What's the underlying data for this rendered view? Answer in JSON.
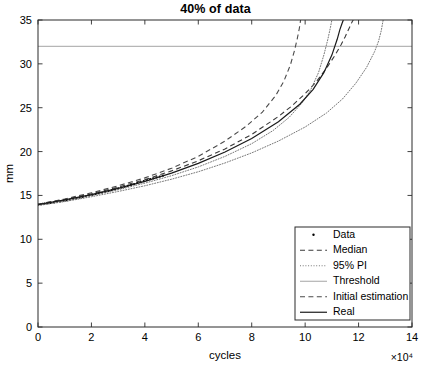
{
  "chart_data": {
    "type": "line",
    "title": "40% of data",
    "xlabel": "cycles",
    "ylabel": "mm",
    "x_exponent_label": "×10⁴",
    "x_multiplier": 10000,
    "xlim": [
      0,
      14
    ],
    "ylim": [
      0,
      35
    ],
    "xticks": [
      0,
      2,
      4,
      6,
      8,
      10,
      12,
      14
    ],
    "yticks": [
      0,
      5,
      10,
      15,
      20,
      25,
      30,
      35
    ],
    "xticklabels": [
      "0",
      "2",
      "4",
      "6",
      "8",
      "10",
      "12",
      "14"
    ],
    "yticklabels": [
      "0",
      "5",
      "10",
      "15",
      "20",
      "25",
      "30",
      "35"
    ],
    "grid": false,
    "legend_position": "lower right",
    "threshold_value": 32,
    "series": [
      {
        "name": "Data",
        "style": "dot-marker",
        "color": "#000000",
        "x": [
          0.0,
          0.12,
          0.24,
          0.36,
          0.48,
          0.6,
          0.72,
          0.84,
          0.96,
          1.08,
          1.2,
          1.32,
          1.44,
          1.56,
          1.68,
          1.8,
          1.92,
          2.04,
          2.16,
          2.28,
          2.4,
          2.52,
          2.64,
          2.76,
          2.88,
          3.0,
          3.12,
          3.24,
          3.36,
          3.48,
          3.6,
          3.72,
          3.84,
          3.96,
          4.08,
          4.2,
          4.32,
          4.44,
          4.56,
          4.68
        ],
        "y": [
          13.95,
          14.0,
          14.05,
          14.1,
          14.15,
          14.2,
          14.28,
          14.33,
          14.4,
          14.45,
          14.52,
          14.6,
          14.68,
          14.75,
          14.82,
          14.9,
          15.0,
          15.08,
          15.16,
          15.25,
          15.33,
          15.42,
          15.5,
          15.6,
          15.7,
          15.8,
          15.9,
          16.0,
          16.1,
          16.2,
          16.3,
          16.42,
          16.52,
          16.63,
          16.74,
          16.85,
          16.95,
          17.05,
          17.15,
          17.25
        ]
      },
      {
        "name": "Median",
        "style": "dashed",
        "color": "#3a3a3a",
        "x": [
          0.0,
          1.0,
          2.0,
          3.0,
          4.0,
          5.0,
          6.0,
          7.0,
          8.0,
          9.0,
          9.5,
          10.0,
          10.4,
          10.8,
          11.1,
          11.35,
          11.5,
          11.62,
          11.7,
          11.76,
          11.8
        ],
        "y": [
          14.0,
          14.55,
          15.2,
          15.95,
          16.8,
          17.8,
          18.95,
          20.3,
          21.95,
          24.0,
          25.2,
          26.6,
          27.9,
          29.5,
          30.9,
          32.2,
          33.1,
          33.9,
          34.4,
          34.8,
          35.0
        ]
      },
      {
        "name": "95% PI",
        "style": "dotted",
        "color": "#777777",
        "x_lower": [
          0.0,
          1.0,
          2.0,
          3.0,
          4.0,
          5.0,
          6.0,
          7.0,
          8.0,
          8.8,
          9.4,
          9.9,
          10.2,
          10.5,
          10.7,
          10.85,
          10.95,
          11.0
        ],
        "y_lower": [
          13.9,
          14.4,
          15.0,
          15.65,
          16.4,
          17.25,
          18.25,
          19.45,
          20.9,
          22.4,
          23.9,
          25.6,
          27.0,
          29.0,
          31.0,
          32.8,
          34.2,
          35.0
        ],
        "x_upper": [
          0.0,
          1.0,
          2.0,
          3.0,
          4.0,
          5.0,
          6.0,
          7.0,
          8.0,
          9.0,
          10.0,
          10.8,
          11.4,
          11.9,
          12.3,
          12.6,
          12.75,
          12.85,
          12.92
        ],
        "y_upper": [
          13.85,
          14.3,
          14.85,
          15.45,
          16.1,
          16.85,
          17.7,
          18.7,
          19.85,
          21.2,
          22.8,
          24.4,
          26.0,
          27.8,
          29.6,
          31.4,
          32.6,
          33.8,
          35.0
        ]
      },
      {
        "name": "Threshold",
        "style": "solid-thin",
        "color": "#9a9a9a",
        "x": [
          0,
          14
        ],
        "y": [
          32,
          32
        ]
      },
      {
        "name": "Initial estimation",
        "style": "dashed",
        "color": "#4a4a4a",
        "x": [
          0.0,
          1.0,
          2.0,
          3.0,
          4.0,
          5.0,
          6.0,
          7.0,
          7.8,
          8.4,
          8.9,
          9.2,
          9.45,
          9.6,
          9.7,
          9.78,
          9.83
        ],
        "y": [
          14.0,
          14.6,
          15.3,
          16.1,
          17.0,
          18.1,
          19.45,
          21.2,
          22.9,
          24.5,
          26.4,
          28.0,
          29.9,
          31.5,
          32.8,
          34.0,
          35.0
        ]
      },
      {
        "name": "Real",
        "style": "solid",
        "color": "#1a1a1a",
        "x": [
          0.0,
          1.0,
          2.0,
          3.0,
          4.0,
          5.0,
          6.0,
          7.0,
          8.0,
          9.0,
          9.8,
          10.3,
          10.7,
          11.0,
          11.2,
          11.3,
          11.38,
          11.43
        ],
        "y": [
          13.95,
          14.5,
          15.1,
          15.8,
          16.6,
          17.55,
          18.65,
          19.95,
          21.5,
          23.4,
          25.4,
          27.1,
          29.0,
          31.0,
          32.8,
          33.9,
          34.6,
          35.0
        ]
      }
    ]
  },
  "legend": {
    "items": [
      {
        "label": "Data",
        "style": "dot-marker"
      },
      {
        "label": "Median",
        "style": "dashed"
      },
      {
        "label": "95% PI",
        "style": "dotted"
      },
      {
        "label": "Threshold",
        "style": "solid-thin"
      },
      {
        "label": "Initial estimation",
        "style": "dashed"
      },
      {
        "label": "Real",
        "style": "solid"
      }
    ]
  }
}
